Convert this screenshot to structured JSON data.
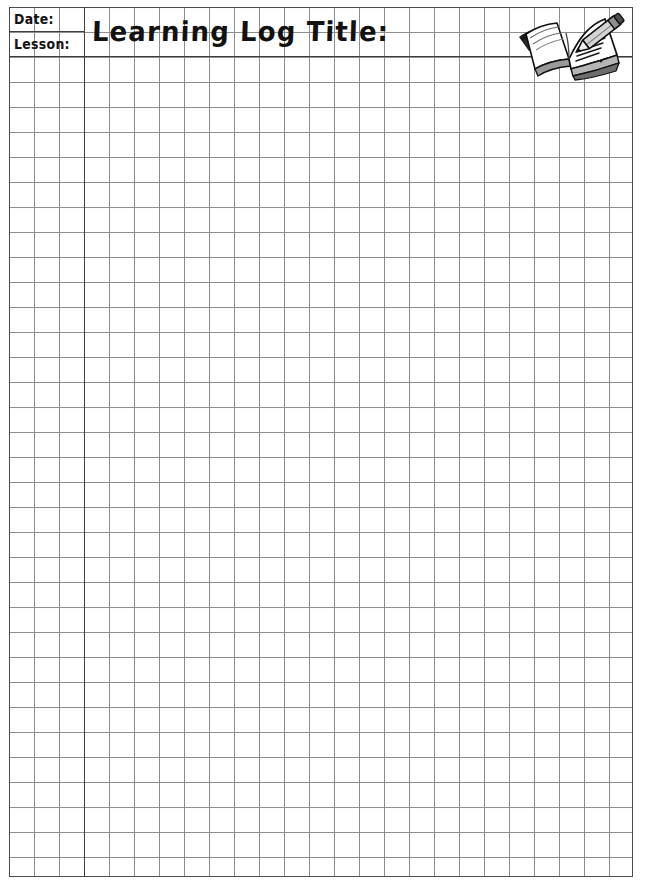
{
  "document": {
    "type": "worksheet-template",
    "page_background": "#ffffff",
    "grid": {
      "cell_size_px": 25,
      "line_color": "#8e8e8e",
      "border_color": "#4a4a4a",
      "columns": 25,
      "rows": 35
    }
  },
  "header": {
    "date_label": "Date:",
    "lesson_label": "Lesson:",
    "title": "Learning Log Title:",
    "divider_color": "#3c3c3c"
  },
  "icons": {
    "book_pencil": "open-book-with-pencil-icon"
  }
}
